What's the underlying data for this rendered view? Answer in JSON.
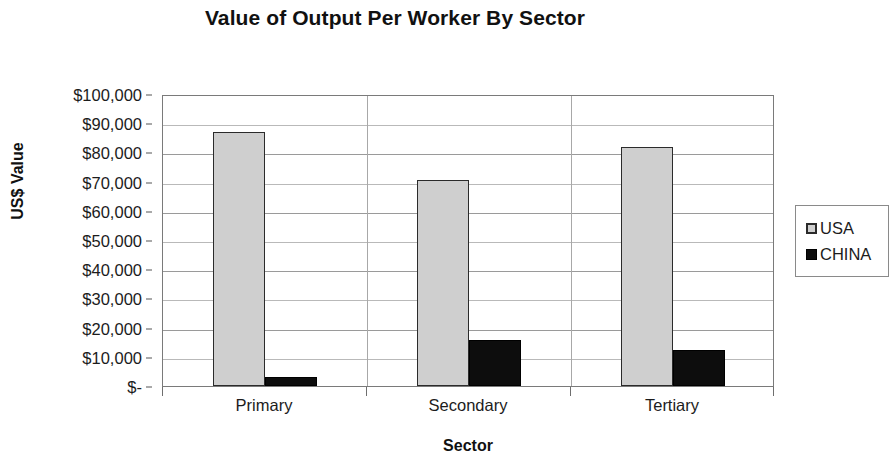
{
  "chart_data": {
    "type": "bar",
    "title": "Value of Output Per Worker By Sector",
    "xlabel": "Sector",
    "ylabel": "US$ Value",
    "categories": [
      "Primary",
      "Secondary",
      "Tertiary"
    ],
    "series": [
      {
        "name": "USA",
        "color": "#cfcfcf",
        "values": [
          87000,
          70500,
          82000
        ]
      },
      {
        "name": "CHINA",
        "color": "#0d0d0d",
        "values": [
          3000,
          15700,
          12300
        ]
      }
    ],
    "ylim": [
      0,
      100000
    ],
    "ytick_values": [
      100000,
      90000,
      80000,
      70000,
      60000,
      50000,
      40000,
      30000,
      20000,
      10000,
      0
    ],
    "ytick_labels": [
      "$100,000",
      "$90,000",
      "$80,000",
      "$70,000",
      "$60,000",
      "$50,000",
      "$40,000",
      "$30,000",
      "$20,000",
      "$10,000",
      "$-"
    ],
    "grid": true,
    "legend_position": "right",
    "legend_entries": [
      "USA",
      "CHINA"
    ]
  }
}
